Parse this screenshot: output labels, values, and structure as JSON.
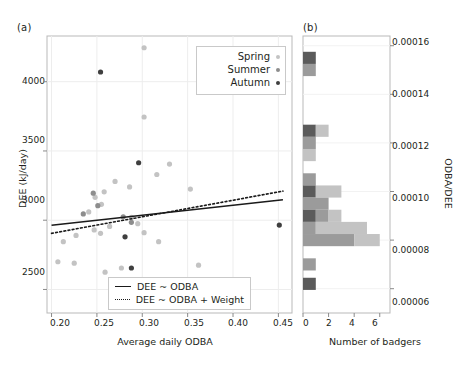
{
  "figure": {
    "panel_a_tag": "(a)",
    "panel_b_tag": "(b)"
  },
  "panel_a": {
    "xlabel": "Average daily ODBA",
    "ylabel": "DEE (kJ/day)",
    "xticks": [
      "0.20",
      "0.25",
      "0.30",
      "0.35",
      "0.40",
      "0.45"
    ],
    "yticks": [
      "2500",
      "3000",
      "3500",
      "4000"
    ],
    "season_legend": {
      "items": [
        {
          "label": "Spring",
          "color": "#c3c3c3"
        },
        {
          "label": "Summer",
          "color": "#8d8d8d"
        },
        {
          "label": "Autumn",
          "color": "#4a4a4a"
        }
      ]
    },
    "model_legend": {
      "items": [
        {
          "label": "DEE ~ ODBA",
          "style": "solid"
        },
        {
          "label": "DEE ~ ODBA + Weight",
          "style": "dotted"
        }
      ]
    }
  },
  "panel_b": {
    "xlabel": "Number of badgers",
    "ylabel": "ODBA/DEE",
    "xticks": [
      "0",
      "2",
      "4",
      "6"
    ],
    "yticks": [
      "0.00006",
      "0.00008",
      "0.00010",
      "0.00012",
      "0.00014",
      "0.00016"
    ]
  },
  "chart_data": [
    {
      "type": "scatter",
      "title": "(a)",
      "xlabel": "Average daily ODBA",
      "ylabel": "DEE (kJ/day)",
      "xlim": [
        0.195,
        0.465
      ],
      "ylim": [
        2330,
        4330
      ],
      "grid": true,
      "legend_position": "top-right",
      "series": [
        {
          "name": "Spring",
          "color": "#c3c3c3",
          "points": [
            [
              0.302,
              4245
            ],
            [
              0.302,
              3745
            ],
            [
              0.33,
              3405
            ],
            [
              0.316,
              3330
            ],
            [
              0.27,
              3280
            ],
            [
              0.353,
              3225
            ],
            [
              0.286,
              3240
            ],
            [
              0.258,
              3205
            ],
            [
              0.248,
              3165
            ],
            [
              0.255,
              3115
            ],
            [
              0.241,
              3060
            ],
            [
              0.288,
              3020
            ],
            [
              0.295,
              2975
            ],
            [
              0.264,
              2955
            ],
            [
              0.247,
              2930
            ],
            [
              0.254,
              2905
            ],
            [
              0.302,
              2910
            ],
            [
              0.227,
              2890
            ],
            [
              0.318,
              2845
            ],
            [
              0.213,
              2845
            ],
            [
              0.207,
              2700
            ],
            [
              0.225,
              2690
            ],
            [
              0.277,
              2655
            ],
            [
              0.362,
              2675
            ],
            [
              0.259,
              2625
            ]
          ]
        },
        {
          "name": "Summer",
          "color": "#8d8d8d",
          "points": [
            [
              0.246,
              3195
            ],
            [
              0.251,
              3105
            ],
            [
              0.235,
              3045
            ],
            [
              0.279,
              3025
            ],
            [
              0.288,
              2985
            ]
          ]
        },
        {
          "name": "Autumn",
          "color": "#3f3f3f",
          "points": [
            [
              0.254,
              4070
            ],
            [
              0.296,
              3415
            ],
            [
              0.281,
              2880
            ],
            [
              0.451,
              2965
            ],
            [
              0.288,
              2655
            ]
          ]
        }
      ],
      "fit_lines": [
        {
          "name": "DEE ~ ODBA",
          "style": "solid",
          "x": [
            0.2,
            0.455
          ],
          "y": [
            2963,
            3147
          ]
        },
        {
          "name": "DEE ~ ODBA + Weight",
          "style": "dotted",
          "x": [
            0.2,
            0.455
          ],
          "y": [
            2905,
            3210
          ]
        }
      ]
    },
    {
      "type": "bar",
      "orientation": "horizontal",
      "stacked": true,
      "title": "(b)",
      "xlabel": "Number of badgers",
      "ylabel": "ODBA/DEE",
      "xlim": [
        0,
        6.8
      ],
      "ylim": [
        5e-05,
        0.000164
      ],
      "bin_width": 5e-06,
      "bins": [
        {
          "center": 0.000155,
          "Spring": 0,
          "Summer": 0,
          "Autumn": 1
        },
        {
          "center": 0.00015,
          "Spring": 0,
          "Summer": 1,
          "Autumn": 0
        },
        {
          "center": 0.000125,
          "Spring": 1,
          "Summer": 0,
          "Autumn": 1
        },
        {
          "center": 0.00012,
          "Spring": 0,
          "Summer": 1,
          "Autumn": 0
        },
        {
          "center": 0.000115,
          "Spring": 1,
          "Summer": 0,
          "Autumn": 0
        },
        {
          "center": 0.000105,
          "Spring": 0,
          "Summer": 1,
          "Autumn": 0
        },
        {
          "center": 0.0001,
          "Spring": 2,
          "Summer": 0,
          "Autumn": 1
        },
        {
          "center": 9.5e-05,
          "Spring": 0,
          "Summer": 2,
          "Autumn": 0
        },
        {
          "center": 9e-05,
          "Spring": 1,
          "Summer": 1,
          "Autumn": 1
        },
        {
          "center": 8.5e-05,
          "Spring": 4,
          "Summer": 1,
          "Autumn": 0
        },
        {
          "center": 8e-05,
          "Spring": 2,
          "Summer": 4,
          "Autumn": 0
        },
        {
          "center": 7e-05,
          "Spring": 0,
          "Summer": 1,
          "Autumn": 0
        },
        {
          "center": 6.2e-05,
          "Spring": 0,
          "Summer": 0,
          "Autumn": 1
        }
      ],
      "series_colors": {
        "Spring": "#c3c3c3",
        "Summer": "#9b9b9b",
        "Autumn": "#5b5b5b"
      }
    }
  ]
}
